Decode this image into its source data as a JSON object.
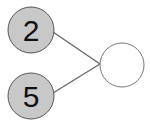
{
  "diagram": {
    "type": "number-bond",
    "parts": [
      {
        "value": "2",
        "fill": "#c8c8c8"
      },
      {
        "value": "5",
        "fill": "#c8c8c8"
      }
    ],
    "whole": {
      "value": "",
      "fill": "#ffffff"
    },
    "stroke": "#555555",
    "line_color": "#666666"
  }
}
